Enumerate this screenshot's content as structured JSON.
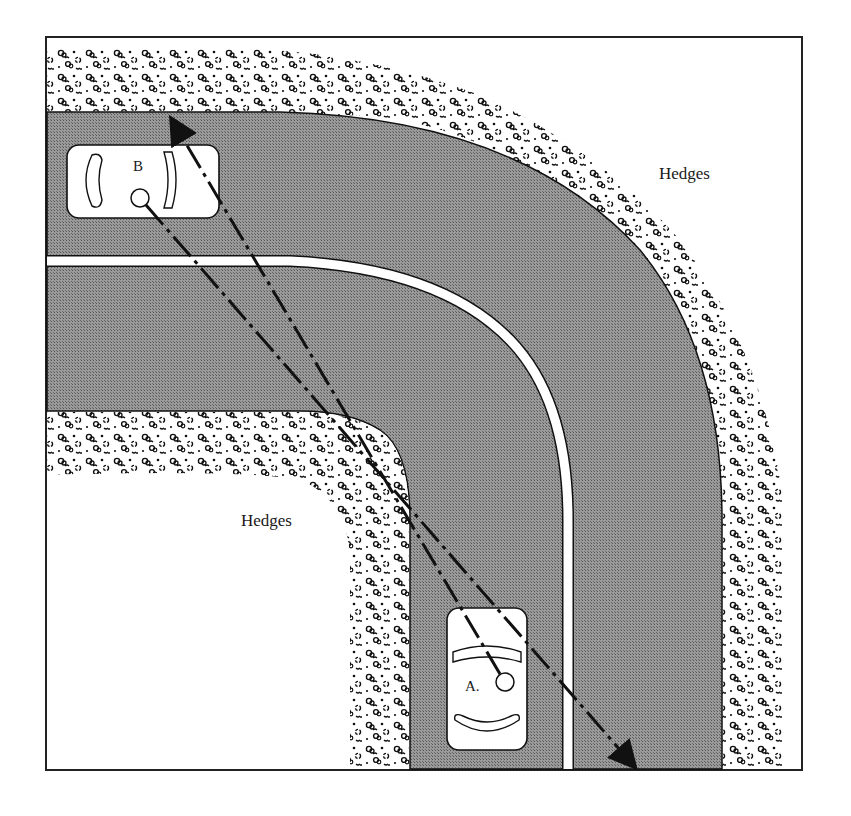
{
  "diagram": {
    "title": "",
    "labels": {
      "hedges_outer": "Hedges",
      "hedges_inner": "Hedges",
      "car_b": "B",
      "car_a": "A."
    },
    "elements": {
      "road": "curved two-lane road turning a 90° corner",
      "center_line": "white center line following the curve",
      "hedges": "stippled hedges on inside and outside of the curve",
      "car_b": "car B in left lane of horizontal segment, driver position marked with circle",
      "car_a": "car A in left lane of vertical segment, driver position marked with circle",
      "sightline_a": "dashed arrow from driver A toward top edge of road past car B",
      "sightline_b": "dashed arrow from driver B toward bottom of road past car A"
    },
    "colors": {
      "road": "#8c8c8c",
      "hedge_bg": "#ffffff",
      "ink": "#111111",
      "line": "#ffffff"
    }
  }
}
